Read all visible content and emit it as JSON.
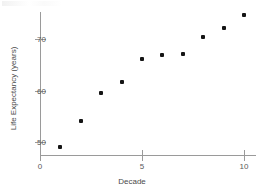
{
  "chart_data": {
    "type": "scatter",
    "title": "",
    "xlabel": "Decade",
    "ylabel": "Life Expectancy (years)",
    "x": [
      1,
      2,
      3,
      4,
      5,
      6,
      7,
      8,
      9,
      10
    ],
    "values": [
      49.0,
      54.1,
      59.5,
      61.7,
      66.2,
      66.8,
      67.0,
      70.3,
      72.1,
      74.6
    ],
    "series": [
      {
        "name": "Life Expectancy",
        "points": [
          {
            "x": 1,
            "y": 49.0
          },
          {
            "x": 2,
            "y": 54.1
          },
          {
            "x": 3,
            "y": 59.5
          },
          {
            "x": 4,
            "y": 61.7
          },
          {
            "x": 5,
            "y": 66.2
          },
          {
            "x": 6,
            "y": 66.8
          },
          {
            "x": 7,
            "y": 67.0
          },
          {
            "x": 8,
            "y": 70.3
          },
          {
            "x": 9,
            "y": 72.1
          },
          {
            "x": 10,
            "y": 74.6
          }
        ]
      }
    ],
    "xlim": [
      0,
      10.6
    ],
    "ylim": [
      47.5,
      76.0
    ],
    "xticks": [
      0,
      5,
      10
    ],
    "xtick_labels": [
      "0",
      "5",
      "10"
    ],
    "yticks": [
      50,
      60,
      70
    ],
    "ytick_labels": [
      "50",
      "60",
      "70"
    ],
    "grid": false,
    "legend": false,
    "marker_color": "#151515",
    "axis_color": "#9a9a9a",
    "text_color": "#4a4a4a"
  }
}
